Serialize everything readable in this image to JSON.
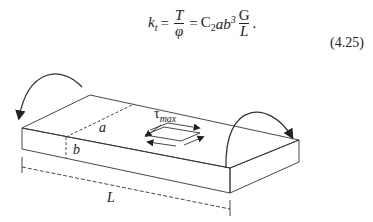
{
  "equation": {
    "lhs": "k",
    "lhs_sub": "t",
    "frac1_num": "T",
    "frac1_den": "φ",
    "coef": "C",
    "coef_sub": "2",
    "vars": "ab",
    "vars_sup": "3",
    "frac2_num": "G",
    "frac2_den": "L",
    "end": ".",
    "eq": "=",
    "number": "(4.25)"
  },
  "figure": {
    "label_a": "a",
    "label_b": "b",
    "label_L": "L",
    "label_tau": "τ",
    "label_tau_sub": "max"
  }
}
